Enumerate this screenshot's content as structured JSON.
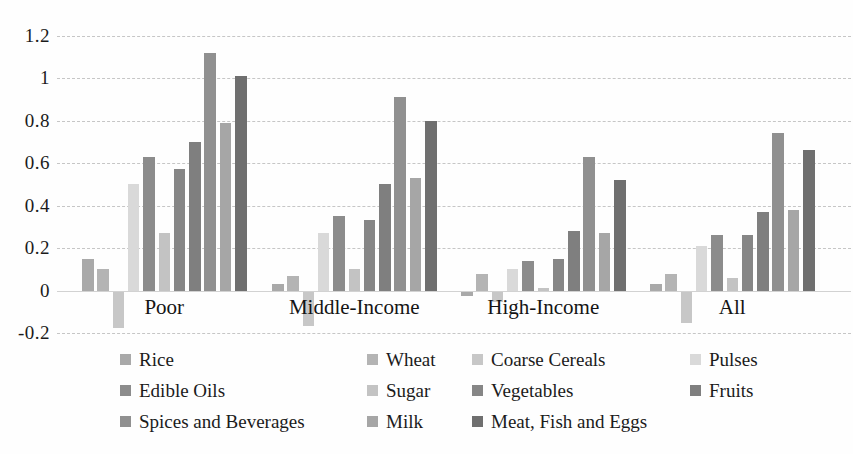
{
  "chart_data": {
    "type": "bar",
    "categories": [
      "Poor",
      "Middle-Income",
      "High-Income",
      "All"
    ],
    "series": [
      {
        "name": "Rice",
        "color": "#a9a9a9",
        "values": [
          0.15,
          0.03,
          -0.02,
          0.03
        ]
      },
      {
        "name": "Wheat",
        "color": "#b4b4b4",
        "values": [
          0.1,
          0.07,
          0.08,
          0.08
        ]
      },
      {
        "name": "Coarse Cereals",
        "color": "#c7c7c7",
        "values": [
          -0.17,
          -0.16,
          -0.05,
          -0.15
        ]
      },
      {
        "name": "Pulses",
        "color": "#d9d9d9",
        "values": [
          0.5,
          0.27,
          0.1,
          0.21
        ]
      },
      {
        "name": "Edible Oils",
        "color": "#8c8c8c",
        "values": [
          0.63,
          0.35,
          0.14,
          0.26
        ]
      },
      {
        "name": "Sugar",
        "color": "#c3c3c3",
        "values": [
          0.27,
          0.1,
          0.01,
          0.06
        ]
      },
      {
        "name": "Vegetables",
        "color": "#868686",
        "values": [
          0.57,
          0.33,
          0.15,
          0.26
        ]
      },
      {
        "name": "Fruits",
        "color": "#7f7f7f",
        "values": [
          0.7,
          0.5,
          0.28,
          0.37
        ]
      },
      {
        "name": "Spices and Beverages",
        "color": "#909090",
        "values": [
          1.12,
          0.91,
          0.63,
          0.74
        ]
      },
      {
        "name": "Milk",
        "color": "#a6a6a6",
        "values": [
          0.79,
          0.53,
          0.27,
          0.38
        ]
      },
      {
        "name": "Meat, Fish and Eggs",
        "color": "#6f6f6f",
        "values": [
          1.01,
          0.8,
          0.52,
          0.66
        ]
      }
    ],
    "ylim": [
      -0.2,
      1.2
    ],
    "ytick_values": [
      1.2,
      1,
      0.8,
      0.6,
      0.4,
      0.2,
      0,
      -0.2
    ],
    "ytick_labels": [
      "1.2",
      "1",
      "0.8",
      "0.6",
      "0.4",
      "0.2",
      "0",
      "-0.2"
    ],
    "grid": "horizontal-dashed",
    "gridline_color": "#c6c6c6",
    "legend_position": "bottom",
    "legend_rows": [
      [
        "Rice",
        "Wheat",
        "Coarse Cereals",
        "Pulses"
      ],
      [
        "Edible Oils",
        "Sugar",
        "Vegetables",
        "Fruits"
      ],
      [
        "Spices and Beverages",
        "Milk",
        "Meat, Fish and Eggs"
      ]
    ],
    "text_color": "#1b1b1b"
  }
}
